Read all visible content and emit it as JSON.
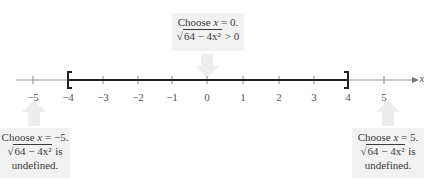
{
  "number_line": {
    "axis_label": "x",
    "ticks": [
      -5,
      -4,
      -3,
      -2,
      -1,
      0,
      1,
      2,
      3,
      4,
      5
    ],
    "tick_labels": [
      "−5",
      "−4",
      "−3",
      "−2",
      "−1",
      "0",
      "1",
      "2",
      "3",
      "4",
      "5"
    ],
    "interval": {
      "start": -4,
      "end": 4,
      "left_bracket": "[",
      "right_bracket": "]",
      "closed": true
    }
  },
  "callouts": {
    "center": {
      "line1_pre": "Choose ",
      "var": "x",
      "line1_post": " = 0.",
      "radicand": "64 − 4x²",
      "line2_post": " > 0"
    },
    "left": {
      "line1_pre": "Choose ",
      "var": "x",
      "line1_post": " = −5.",
      "radicand": "64 − 4x²",
      "line2_post": " is",
      "line3": "undefined."
    },
    "right": {
      "line1_pre": "Choose ",
      "var": "x",
      "line1_post": " = 5.",
      "radicand": "64 − 4x²",
      "line2_post": " is",
      "line3": "undefined."
    }
  },
  "colors": {
    "box_bg": "#f1f1f1",
    "arrow": "#e6e6e6",
    "axis": "#888888",
    "interval": "#222222"
  }
}
